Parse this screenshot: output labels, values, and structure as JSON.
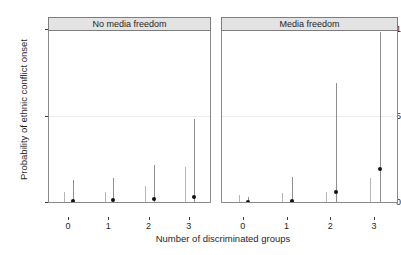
{
  "chart_data": {
    "type": "scatter",
    "title": "",
    "xlabel": "Number of discriminated groups",
    "ylabel": "Probability of ethnic conflict onset",
    "xlim": [
      -0.5,
      3.5
    ],
    "ylim": [
      0,
      1
    ],
    "yticks": [
      "0",
      "0.5",
      "1"
    ],
    "ytick_values": [
      0,
      0.5,
      1
    ],
    "xticks": [
      "0",
      "1",
      "2",
      "3"
    ],
    "xtick_values": [
      0,
      1,
      2,
      3
    ],
    "grid": "horizontal-light",
    "legend": "none",
    "zero_reference_line": 0,
    "facets": [
      {
        "label": "No media freedom",
        "x": [
          0,
          1,
          2,
          3
        ],
        "series": [
          {
            "name": "lower-estimate",
            "style": "light-errorbar",
            "offset": -0.12,
            "points": [
              {
                "x": 0,
                "estimate": 0.005,
                "ci_low": 0.0,
                "ci_high": 0.055
              },
              {
                "x": 1,
                "estimate": 0.005,
                "ci_low": 0.0,
                "ci_high": 0.06
              },
              {
                "x": 2,
                "estimate": 0.005,
                "ci_low": 0.0,
                "ci_high": 0.09
              },
              {
                "x": 3,
                "estimate": 0.005,
                "ci_low": 0.0,
                "ci_high": 0.2
              }
            ]
          },
          {
            "name": "point-estimate",
            "style": "dark-errorbar-with-point",
            "offset": 0.1,
            "points": [
              {
                "x": 0,
                "estimate": 0.02,
                "ci_low": 0.0,
                "ci_high": 0.13
              },
              {
                "x": 1,
                "estimate": 0.022,
                "ci_low": 0.0,
                "ci_high": 0.14
              },
              {
                "x": 2,
                "estimate": 0.03,
                "ci_low": 0.0,
                "ci_high": 0.215
              },
              {
                "x": 3,
                "estimate": 0.038,
                "ci_low": 0.0,
                "ci_high": 0.48
              }
            ]
          }
        ]
      },
      {
        "label": "Media freedom",
        "x": [
          0,
          1,
          2,
          3
        ],
        "series": [
          {
            "name": "lower-estimate",
            "style": "light-errorbar",
            "offset": -0.12,
            "points": [
              {
                "x": 0,
                "estimate": 0.003,
                "ci_low": 0.0,
                "ci_high": 0.04
              },
              {
                "x": 1,
                "estimate": 0.004,
                "ci_low": 0.0,
                "ci_high": 0.05
              },
              {
                "x": 2,
                "estimate": 0.005,
                "ci_low": 0.0,
                "ci_high": 0.06
              },
              {
                "x": 3,
                "estimate": 0.006,
                "ci_low": 0.0,
                "ci_high": 0.14
              }
            ]
          },
          {
            "name": "point-estimate",
            "style": "dark-errorbar-with-point",
            "offset": 0.1,
            "points": [
              {
                "x": 0,
                "estimate": 0.01,
                "ci_low": 0.0,
                "ci_high": 0.03
              },
              {
                "x": 1,
                "estimate": 0.02,
                "ci_low": 0.0,
                "ci_high": 0.145
              },
              {
                "x": 2,
                "estimate": 0.068,
                "ci_low": 0.0,
                "ci_high": 0.69
              },
              {
                "x": 3,
                "estimate": 0.205,
                "ci_low": 0.0,
                "ci_high": 0.98
              }
            ]
          }
        ]
      }
    ],
    "colors": {
      "point": "#111111",
      "errorbar_dark": "#8f8f8f",
      "errorbar_light": "#b6b6b6",
      "gridline": "#ececec",
      "strip_background": "#e3e3e3",
      "panel_border": "#8a8a8a",
      "zero_line": "#111111",
      "background": "#ffffff"
    }
  }
}
